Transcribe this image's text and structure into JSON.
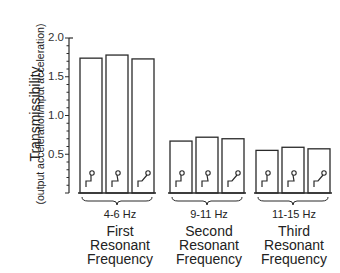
{
  "chart_data": {
    "type": "bar",
    "title": "",
    "ylabel": "Transmissibility",
    "ylabel_sub": "(output acceleration/input acceleration)",
    "xlabel": "",
    "ylim": [
      0,
      2.0
    ],
    "yticks": [
      "0.5",
      "1.0",
      "1.5",
      "2.0"
    ],
    "grid": false,
    "legend": "none",
    "groups": [
      {
        "freq": "4-6 Hz",
        "name_lines": [
          "First",
          "Resonant",
          "Frequency"
        ],
        "values": [
          1.74,
          1.78,
          1.73
        ]
      },
      {
        "freq": "9-11 Hz",
        "name_lines": [
          "Second",
          "Resonant",
          "Frequency"
        ],
        "values": [
          0.67,
          0.72,
          0.7
        ]
      },
      {
        "freq": "11-15 Hz",
        "name_lines": [
          "Third",
          "Resonant",
          "Frequency"
        ],
        "values": [
          0.55,
          0.59,
          0.57
        ]
      }
    ],
    "series": [
      {
        "name": "upright posture",
        "icon": "seated-figure-upright-icon"
      },
      {
        "name": "slumped posture",
        "icon": "seated-figure-slumped-icon"
      },
      {
        "name": "reclined posture",
        "icon": "seated-figure-reclined-icon"
      }
    ]
  },
  "axis": {
    "title": "Transmissibility",
    "subtitle": "(output acceleration/input acceleration)",
    "ticks": [
      "2.0",
      "1.5",
      "1.0",
      "0.5"
    ]
  },
  "groups": [
    {
      "freq": "4-6 Hz",
      "l1": "First",
      "l2": "Resonant",
      "l3": "Frequency"
    },
    {
      "freq": "9-11 Hz",
      "l1": "Second",
      "l2": "Resonant",
      "l3": "Frequency"
    },
    {
      "freq": "11-15 Hz",
      "l1": "Third",
      "l2": "Resonant",
      "l3": "Frequency"
    }
  ]
}
